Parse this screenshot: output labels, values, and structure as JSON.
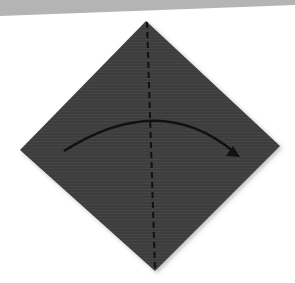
{
  "diagram": {
    "type": "origami-fold-step",
    "paper_color": "#3e3e3e",
    "background_band_color": "#b4b4b4",
    "background_color": "#ffffff",
    "fold_line": "valley-fold-dashed-vertical",
    "arrow": "fold-left-to-right"
  }
}
